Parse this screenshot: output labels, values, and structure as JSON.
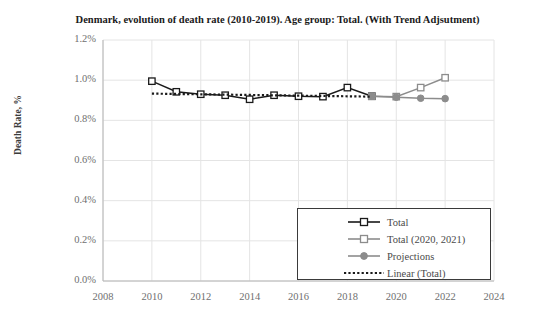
{
  "chart_data": {
    "type": "line",
    "title": "Denmark, evolution of death rate (2010-2019). Age group: Total. (With Trend Adjsutment)",
    "xlabel": "",
    "ylabel": "Death Rate, %",
    "xlim": [
      2008,
      2024
    ],
    "ylim": [
      0.0,
      1.2
    ],
    "xticks": [
      "2008",
      "2010",
      "2012",
      "2014",
      "2016",
      "2018",
      "2020",
      "2022",
      "2024"
    ],
    "xtick_values": [
      2008,
      2010,
      2012,
      2014,
      2016,
      2018,
      2020,
      2022,
      2024
    ],
    "yticks": [
      "0.0%",
      "0.2%",
      "0.4%",
      "0.6%",
      "0.8%",
      "1.0%",
      "1.2%"
    ],
    "ytick_values": [
      0.0,
      0.2,
      0.4,
      0.6,
      0.8,
      1.0,
      1.2
    ],
    "grid": true,
    "grid_axes": "both",
    "grid_color": "#e4e4e4",
    "legend_position": "inside-bottom-right",
    "series": [
      {
        "name": "Total",
        "color": "#1a1a1a",
        "marker": "square-open",
        "linestyle": "solid",
        "x": [
          2010,
          2011,
          2012,
          2013,
          2014,
          2015,
          2016,
          2017,
          2018,
          2019
        ],
        "values": [
          0.995,
          0.942,
          0.93,
          0.925,
          0.905,
          0.925,
          0.92,
          0.918,
          0.963,
          0.92
        ]
      },
      {
        "name": "Total (2020, 2021)",
        "color": "#8c8c8c",
        "marker": "square-open",
        "linestyle": "solid",
        "x": [
          2019,
          2020,
          2021,
          2022
        ],
        "values": [
          0.92,
          0.918,
          0.963,
          1.012
        ]
      },
      {
        "name": "Projections",
        "color": "#8c8c8c",
        "marker": "circle-filled",
        "linestyle": "solid",
        "x": [
          2019,
          2020,
          2021,
          2022
        ],
        "values": [
          0.92,
          0.915,
          0.91,
          0.908
        ]
      },
      {
        "name": "Linear (Total)",
        "color": "#1a1a1a",
        "marker": "none",
        "linestyle": "dotted",
        "x": [
          2010,
          2019
        ],
        "values": [
          0.933,
          0.918
        ]
      }
    ],
    "legend_entries": [
      {
        "label": "Total",
        "color": "#1a1a1a",
        "marker": "square-open",
        "linestyle": "solid"
      },
      {
        "label": "Total (2020, 2021)",
        "color": "#8c8c8c",
        "marker": "square-open",
        "linestyle": "solid"
      },
      {
        "label": "Projections",
        "color": "#8c8c8c",
        "marker": "circle-filled",
        "linestyle": "solid"
      },
      {
        "label": "Linear (Total)",
        "color": "#1a1a1a",
        "marker": "none",
        "linestyle": "dotted"
      }
    ]
  }
}
